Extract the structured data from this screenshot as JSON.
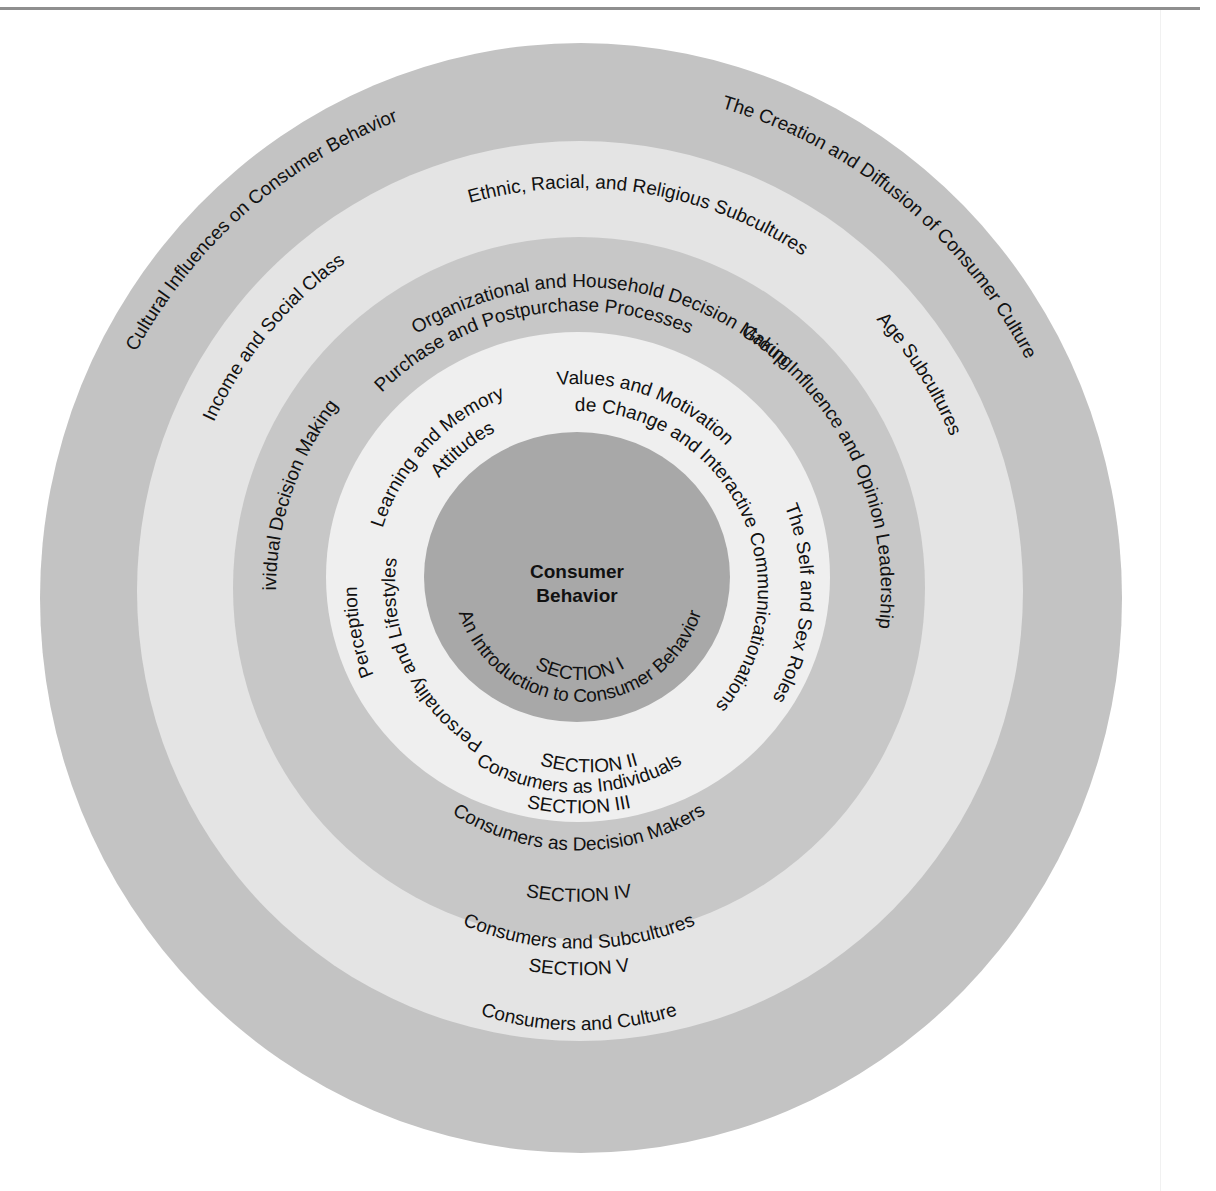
{
  "diagram": {
    "type": "concentric-rings",
    "core": {
      "title_line1": "Consumer",
      "title_line2": "Behavior"
    },
    "colors": {
      "section1": "#a8a8a8",
      "section2": "#efefef",
      "section3": "#c7c7c7",
      "section4": "#e4e4e4",
      "section5": "#c3c3c3",
      "text": "#111111",
      "rule": "#8f8f8f"
    },
    "sections": [
      {
        "id": "I",
        "heading": "SECTION I",
        "title": "An Introduction to Consumer Behavior",
        "topics": []
      },
      {
        "id": "II",
        "heading": "SECTION II",
        "title": "Consumers as Individuals",
        "topics": [
          "Perception",
          "Learning and Memory",
          "Values and Motivation",
          "The Self and Sex Roles",
          "Personality and Lifestyles",
          "Attitudes",
          "Attitude Change and Interactive Communicationations"
        ]
      },
      {
        "id": "III",
        "heading": "SECTION III",
        "title": "Consumers as Decision Makers",
        "topics": [
          "Individual Decision Making",
          "Purchase and Postpurchase Processes",
          "Group Influence and Opinion Leadership",
          "Organizational and Household Decision Making"
        ]
      },
      {
        "id": "IV",
        "heading": "SECTION IV",
        "title": "Consumers and Subcultures",
        "topics": [
          "Income and Social Class",
          "Ethnic, Racial, and Religious Subcultures",
          "Age Subcultures"
        ]
      },
      {
        "id": "V",
        "heading": "SECTION V",
        "title": "Consumers and Culture",
        "topics": [
          "Cultural Influences on Consumer Behavior",
          "The Creation and Diffusion of Consumer Culture"
        ]
      }
    ]
  }
}
